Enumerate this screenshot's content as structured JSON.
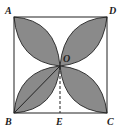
{
  "diagram": {
    "type": "geometry",
    "colors": {
      "fill": "#8a8a8a",
      "stroke": "#222222",
      "background": "#ffffff"
    },
    "labels": {
      "A": "A",
      "B": "B",
      "C": "C",
      "D": "D",
      "E": "E",
      "O": "O"
    },
    "points": {
      "A": [
        14,
        17
      ],
      "B": [
        14,
        113
      ],
      "C": [
        107,
        113
      ],
      "D": [
        107,
        17
      ],
      "O": [
        60,
        66
      ],
      "E": [
        60,
        113
      ]
    }
  }
}
